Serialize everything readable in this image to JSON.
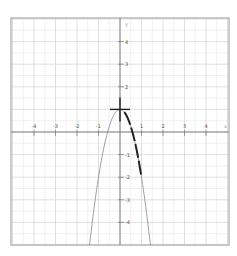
{
  "chart_data": {
    "type": "line",
    "title": "",
    "xlabel": "x",
    "ylabel": "y",
    "xlim": [
      -5,
      5
    ],
    "ylim": [
      -5,
      5
    ],
    "grid": true,
    "minor_grid_step": 0.5,
    "x_ticks": [
      -4,
      -3,
      -2,
      -1,
      1,
      2,
      3,
      4
    ],
    "y_ticks": [
      4,
      3,
      2,
      -1,
      -2,
      -3,
      -4
    ],
    "x_tick_labels": [
      "-4",
      "-3",
      "-2",
      "-1",
      "1",
      "2",
      "3",
      "4"
    ],
    "y_tick_labels": [
      "4",
      "3",
      "2",
      "-1",
      "-2",
      "-3",
      "-4"
    ],
    "series": [
      {
        "name": "parabola",
        "equation": "y = 1 - 3x^2",
        "style": "thin",
        "color": "#888888",
        "x_range": [
          -1.45,
          1.45
        ]
      },
      {
        "name": "highlighted segment",
        "equation": "y = 1 - 3x^2",
        "style": "thick dashed",
        "color": "#222222",
        "x_range": [
          0.2,
          1.0
        ]
      }
    ],
    "annotations": [
      {
        "type": "cross-marker",
        "x": 0,
        "y": 1,
        "color": "#222222"
      }
    ]
  },
  "frame": {
    "left": 11,
    "top": 18,
    "right": 229,
    "bottom": 245
  },
  "origin_px": {
    "x": 120,
    "y": 132
  },
  "unit_px": {
    "x": 21.5,
    "y": 22.6
  },
  "colors": {
    "frame": "#aaaaaa",
    "major_grid": "#d8d8d8",
    "minor_grid": "#eeeeee",
    "axis": "#777777",
    "curve": "#888888",
    "highlight": "#222222"
  }
}
